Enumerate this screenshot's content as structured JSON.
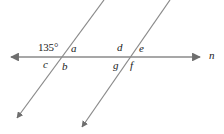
{
  "figure": {
    "type": "geometry-diagram",
    "width": 224,
    "height": 134,
    "background_color": "#ffffff",
    "line_color": "#8a8a8a",
    "text_color": "#1a1a1a"
  },
  "lines": {
    "horizontal": {
      "name": "n",
      "label": "n",
      "y": 57,
      "x_start": 6,
      "x_end": 205,
      "arrow_left": true,
      "arrow_right": true,
      "color": "#8a8a8a"
    },
    "transversal_left": {
      "top_x": 104,
      "top_y": 0,
      "bottom_x": 14,
      "bottom_y": 122,
      "arrow_bottom": true,
      "color": "#8a8a8a"
    },
    "transversal_right": {
      "top_x": 170,
      "top_y": 0,
      "bottom_x": 79,
      "bottom_y": 131,
      "arrow_bottom": true,
      "color": "#8a8a8a"
    }
  },
  "intersections": [
    {
      "name": "left-intersection",
      "x": 67,
      "y": 57,
      "angles": {
        "upper_left": "135°",
        "upper_right": "a",
        "lower_left": "c",
        "lower_right": "b"
      }
    },
    {
      "name": "right-intersection",
      "x": 134,
      "y": 57,
      "angles": {
        "upper_left": "d",
        "upper_right": "e",
        "lower_left": "g",
        "lower_right": "f"
      }
    }
  ],
  "labels": {
    "angle_135": "135°",
    "angle_a": "a",
    "angle_b": "b",
    "angle_c": "c",
    "angle_d": "d",
    "angle_e": "e",
    "angle_f": "f",
    "angle_g": "g",
    "line_n": "n"
  }
}
